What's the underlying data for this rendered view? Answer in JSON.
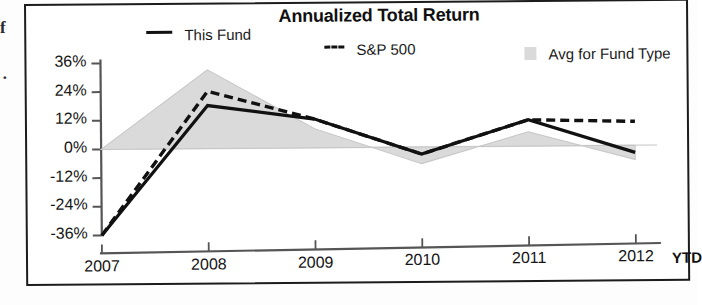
{
  "page": {
    "margin_scrap_letter": "f",
    "margin_scrap_dot": "·"
  },
  "chart": {
    "title": "Annualized Total Return",
    "legend": [
      {
        "label": "This Fund",
        "marker": "solid-line",
        "color": "#111111"
      },
      {
        "label": "S&P 500",
        "marker": "dashed-line",
        "color": "#111111"
      },
      {
        "label": "Avg for Fund Type",
        "marker": "filled-box",
        "color": "#dadada"
      }
    ],
    "x_axis_suffix": "YTD"
  },
  "chart_data": {
    "type": "line",
    "title": "Annualized Total Return",
    "xlabel": "",
    "ylabel": "",
    "categories": [
      "2007",
      "2008",
      "2009",
      "2010",
      "2011",
      "2012"
    ],
    "x_tick_labels": [
      "2007",
      "2008",
      "2009",
      "2010",
      "2011",
      "2012"
    ],
    "x_tick_suffix": "YTD",
    "y_tick_labels": [
      "36%",
      "24%",
      "12%",
      "0%",
      "-12%",
      "-24%",
      "-36%"
    ],
    "y_tick_values": [
      36,
      24,
      12,
      0,
      -12,
      -24,
      -36
    ],
    "ylim": [
      -36,
      36
    ],
    "grid": false,
    "legend_position": "top",
    "series": [
      {
        "name": "This Fund",
        "style": "solid",
        "color": "#111111",
        "values": [
          -36,
          18,
          12,
          -3,
          11,
          -3
        ]
      },
      {
        "name": "S&P 500",
        "style": "dashed",
        "color": "#111111",
        "values": [
          -36,
          24,
          12,
          -3,
          11,
          10
        ]
      },
      {
        "name": "Avg for Fund Type",
        "style": "area",
        "color": "#dadada",
        "values": [
          0,
          33,
          8,
          -7,
          6,
          -6
        ]
      }
    ],
    "area_baseline": 0
  }
}
